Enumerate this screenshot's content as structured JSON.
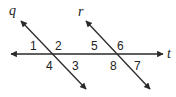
{
  "diagram": {
    "lines": [
      {
        "name": "q",
        "x1": 21,
        "y1": 21,
        "x2": 86,
        "y2": 89
      },
      {
        "name": "r",
        "x1": 86,
        "y1": 21,
        "x2": 150,
        "y2": 89
      },
      {
        "name": "t",
        "x1": 11,
        "y1": 54,
        "x2": 163,
        "y2": 54
      }
    ],
    "line_labels": {
      "q": "q",
      "r": "r",
      "t": "t"
    },
    "angle_labels": [
      "1",
      "2",
      "3",
      "4",
      "5",
      "6",
      "7",
      "8"
    ],
    "stroke_color": "#2a2a2a"
  }
}
